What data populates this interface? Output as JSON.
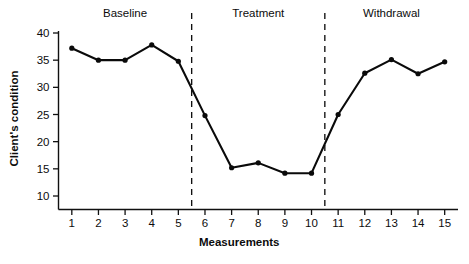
{
  "chart_data": {
    "type": "line",
    "title": "",
    "xlabel": "Measurements",
    "ylabel": "Client's condition",
    "x": [
      1,
      2,
      3,
      4,
      5,
      6,
      7,
      8,
      9,
      10,
      11,
      12,
      13,
      14,
      15
    ],
    "values": [
      37.2,
      35.0,
      35.0,
      37.8,
      34.8,
      24.8,
      15.2,
      16.1,
      14.2,
      14.2,
      25.0,
      32.6,
      35.1,
      32.5,
      34.7
    ],
    "series": [
      {
        "name": "Client's condition",
        "values": [
          37.2,
          35.0,
          35.0,
          37.8,
          34.8,
          24.8,
          15.2,
          16.1,
          14.2,
          14.2,
          25.0,
          32.6,
          35.1,
          32.5,
          34.7
        ]
      }
    ],
    "xtick_labels": [
      "1",
      "2",
      "3",
      "4",
      "5",
      "6",
      "7",
      "8",
      "9",
      "10",
      "11",
      "12",
      "13",
      "14",
      "15"
    ],
    "ytick_labels": [
      "10",
      "15",
      "20",
      "25",
      "30",
      "35",
      "40"
    ],
    "ytick_values": [
      10,
      15,
      20,
      25,
      30,
      35,
      40
    ],
    "xlim": [
      0.5,
      15.5
    ],
    "ylim": [
      7,
      40
    ],
    "grid": false,
    "legend": "none",
    "marker": "filled-circle",
    "line_color": "#0a0a0a",
    "annotations": [
      {
        "label": "Baseline",
        "x_center": 3.0,
        "phase_start": 0.5,
        "phase_end": 5.5
      },
      {
        "label": "Treatment",
        "x_center": 8.0,
        "phase_start": 5.5,
        "phase_end": 10.5
      },
      {
        "label": "Withdrawal",
        "x_center": 13.0,
        "phase_start": 10.5,
        "phase_end": 15.5
      }
    ],
    "phase_dividers": [
      5.5,
      10.5
    ]
  }
}
